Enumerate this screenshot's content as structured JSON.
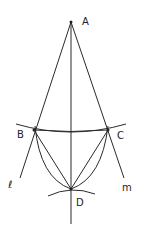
{
  "diagram": {
    "points": [
      {
        "label": "A",
        "x": 71,
        "y": 22
      },
      {
        "label": "B",
        "x": 34,
        "y": 130
      },
      {
        "label": "C",
        "x": 108,
        "y": 130
      },
      {
        "label": "D",
        "x": 71,
        "y": 189
      }
    ],
    "lines": [
      {
        "label": "l"
      },
      {
        "label": "m"
      }
    ],
    "labels": {
      "A": "A",
      "B": "B",
      "C": "C",
      "D": "D",
      "l": "ℓ",
      "m": "m"
    }
  }
}
